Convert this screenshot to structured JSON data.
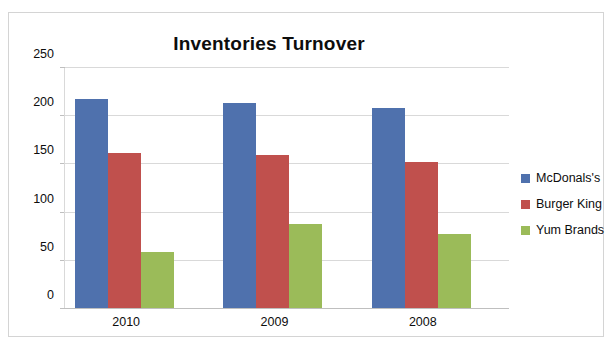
{
  "page": {
    "top_sliver_text": ""
  },
  "chart_data": {
    "type": "bar",
    "title": "Inventories Turnover",
    "xlabel": "",
    "ylabel": "",
    "categories": [
      "2010",
      "2009",
      "2008"
    ],
    "series": [
      {
        "name": "McDonals's",
        "color": "#4f71ad",
        "values": [
          218,
          214,
          209
        ]
      },
      {
        "name": "Burger King",
        "color": "#c0504d",
        "values": [
          162,
          160,
          153
        ]
      },
      {
        "name": "Yum Brands",
        "color": "#9bbb59",
        "values": [
          59,
          88,
          78
        ]
      }
    ],
    "ylim": [
      0,
      250
    ],
    "yticks": [
      0,
      50,
      100,
      150,
      200,
      250
    ],
    "ytick_labels": [
      "0",
      "50",
      "100",
      "150",
      "200",
      "250"
    ],
    "grid": true,
    "legend_position": "right"
  }
}
